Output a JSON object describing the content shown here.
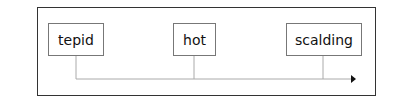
{
  "diagram": {
    "nodes": [
      {
        "label": "tepid"
      },
      {
        "label": "hot"
      },
      {
        "label": "scalding"
      }
    ],
    "connector": "horizontal timeline arrow pointing right",
    "colors": {
      "frame": "#333333",
      "node_border": "#777777",
      "line": "#aaaaaa",
      "arrow": "#111111"
    }
  }
}
